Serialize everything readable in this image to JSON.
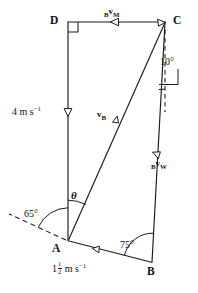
{
  "figure": {
    "stroke_color": "#1a1a1a",
    "background_color": "#ffffff",
    "vertices": [
      {
        "name": "D",
        "label": "D",
        "x": 68,
        "y": 22
      },
      {
        "name": "C",
        "label": "C",
        "x": 165,
        "y": 22
      },
      {
        "name": "A",
        "label": "A",
        "x": 68,
        "y": 240
      },
      {
        "name": "B",
        "label": "B",
        "x": 152,
        "y": 262
      }
    ],
    "angles": [
      {
        "name": "angle-at-c",
        "label": "10°",
        "value": 10,
        "at": "C",
        "between": "CB-and-vertical-dashed"
      },
      {
        "name": "angle-at-a-dashed",
        "label": "65°",
        "value": 65,
        "at": "A",
        "between": "dashed-ray-and-AD"
      },
      {
        "name": "angle-theta",
        "label": "θ",
        "value": null,
        "at": "A",
        "between": "AD-and-AC"
      },
      {
        "name": "angle-at-b",
        "label": "75°",
        "value": 75,
        "at": "B",
        "between": "BA-and-BC"
      }
    ],
    "vector_labels": [
      {
        "name": "vector-b-v-m",
        "pre": "B",
        "v": "v",
        "sub": "M",
        "on_segment": "C-to-D",
        "direction": "leftward"
      },
      {
        "name": "vector-v-b",
        "pre": "",
        "v": "v",
        "sub": "B",
        "on_segment": "A-to-C",
        "direction": "toward-C"
      },
      {
        "name": "vector-b-v-w",
        "pre": "B",
        "v": "v",
        "sub": "W",
        "on_segment": "C-to-B",
        "direction": "toward-B"
      }
    ],
    "speeds": [
      {
        "name": "speed-da",
        "text_parts": {
          "whole": "4",
          "fraction": null,
          "unit": "m s",
          "exponent": "−1"
        },
        "on_segment": "D-to-A",
        "direction": "downward"
      },
      {
        "name": "speed-ab",
        "text_parts": {
          "whole": "1",
          "fraction": {
            "num": "1",
            "den": "2"
          },
          "unit": "m s",
          "exponent": "−1"
        },
        "on_segment": "A-to-B",
        "direction": "toward-B"
      }
    ],
    "units_label": "m s",
    "exponent_label": "−1"
  }
}
